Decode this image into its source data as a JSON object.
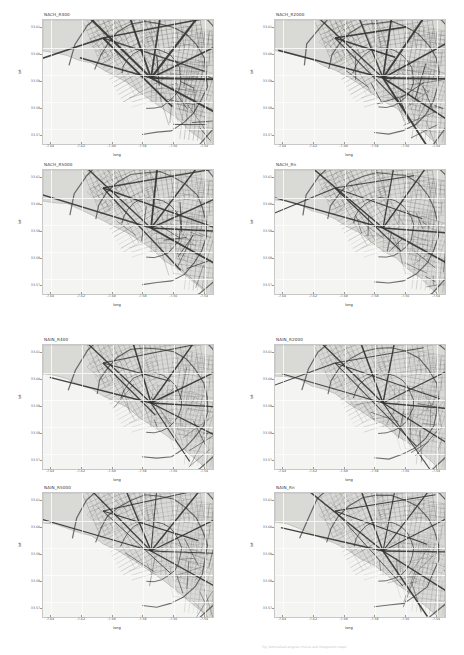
{
  "document": {
    "kind": "figure-sheet",
    "footnote": "Fig. Normalised angular choice and integration maps"
  },
  "chart_data": {
    "type": "map",
    "panel_count": 8,
    "layout": {
      "columns": 2,
      "rows": 4
    },
    "shared": {
      "xlabel": "long",
      "ylabel": "lat",
      "grid": true,
      "projection": "lat/long degrees",
      "basemap_land_color": "#d9d9d6",
      "basemap_water_color": "#fafaf8",
      "street_color": "#3c3c3c"
    },
    "panels": [
      {
        "title": "NACH_R400",
        "measure": "NACH",
        "radius": "400",
        "xlabel": "long",
        "ylabel": "lat",
        "xticks": [
          "-7.64",
          "-7.62",
          "-7.60",
          "-7.58",
          "-7.56",
          "-7.54"
        ],
        "yticks": [
          "33.61",
          "33.60",
          "33.59",
          "33.58",
          "33.57"
        ],
        "xlim": [
          -7.65,
          -7.535
        ],
        "ylim": [
          33.565,
          33.615
        ],
        "density": 1.0
      },
      {
        "title": "NACH_R2000",
        "measure": "NACH",
        "radius": "2000",
        "xlabel": "long",
        "ylabel": "lat",
        "xticks": [
          "-7.64",
          "-7.62",
          "-7.60",
          "-7.58",
          "-7.56",
          "-7.54"
        ],
        "yticks": [
          "33.61",
          "33.60",
          "33.59",
          "33.58",
          "33.57"
        ],
        "xlim": [
          -7.65,
          -7.535
        ],
        "ylim": [
          33.565,
          33.615
        ],
        "density": 0.92
      },
      {
        "title": "NACH_R5000",
        "measure": "NACH",
        "radius": "5000",
        "xlabel": "long",
        "ylabel": "lat",
        "xticks": [
          "-7.64",
          "-7.62",
          "-7.60",
          "-7.58",
          "-7.56",
          "-7.54"
        ],
        "yticks": [
          "33.61",
          "33.60",
          "33.59",
          "33.58",
          "33.57"
        ],
        "xlim": [
          -7.65,
          -7.535
        ],
        "ylim": [
          33.565,
          33.615
        ],
        "density": 0.88
      },
      {
        "title": "NACH_Rn",
        "measure": "NACH",
        "radius": "n",
        "xlabel": "long",
        "ylabel": "lat",
        "xticks": [
          "-7.64",
          "-7.62",
          "-7.60",
          "-7.58",
          "-7.56",
          "-7.54"
        ],
        "yticks": [
          "33.61",
          "33.60",
          "33.59",
          "33.58",
          "33.57"
        ],
        "xlim": [
          -7.65,
          -7.535
        ],
        "ylim": [
          33.565,
          33.615
        ],
        "density": 0.8
      },
      {
        "title": "NAIN_R400",
        "measure": "NAIN",
        "radius": "400",
        "xlabel": "long",
        "ylabel": "lat",
        "xticks": [
          "-7.64",
          "-7.62",
          "-7.60",
          "-7.58",
          "-7.56",
          "-7.54"
        ],
        "yticks": [
          "33.61",
          "33.60",
          "33.59",
          "33.58",
          "33.57"
        ],
        "xlim": [
          -7.65,
          -7.535
        ],
        "ylim": [
          33.565,
          33.615
        ],
        "density": 0.72
      },
      {
        "title": "NAIN_R2000",
        "measure": "NAIN",
        "radius": "2000",
        "xlabel": "long",
        "ylabel": "lat",
        "xticks": [
          "-7.64",
          "-7.62",
          "-7.60",
          "-7.58",
          "-7.56",
          "-7.54"
        ],
        "yticks": [
          "33.61",
          "33.60",
          "33.59",
          "33.58",
          "33.57"
        ],
        "xlim": [
          -7.65,
          -7.535
        ],
        "ylim": [
          33.565,
          33.615
        ],
        "density": 0.7
      },
      {
        "title": "NAIN_R5000",
        "measure": "NAIN",
        "radius": "5000",
        "xlabel": "long",
        "ylabel": "lat",
        "xticks": [
          "-7.64",
          "-7.62",
          "-7.60",
          "-7.58",
          "-7.56",
          "-7.54"
        ],
        "yticks": [
          "33.61",
          "33.60",
          "33.59",
          "33.58",
          "33.57"
        ],
        "xlim": [
          -7.65,
          -7.535
        ],
        "ylim": [
          33.565,
          33.615
        ],
        "density": 0.68
      },
      {
        "title": "NAIN_Rn",
        "measure": "NAIN",
        "radius": "n",
        "xlabel": "long",
        "ylabel": "lat",
        "xticks": [
          "-7.64",
          "-7.62",
          "-7.60",
          "-7.58",
          "-7.56",
          "-7.54"
        ],
        "yticks": [
          "33.61",
          "33.60",
          "33.59",
          "33.58",
          "33.57"
        ],
        "xlim": [
          -7.65,
          -7.535
        ],
        "ylim": [
          33.565,
          33.615
        ],
        "density": 0.66
      }
    ]
  }
}
